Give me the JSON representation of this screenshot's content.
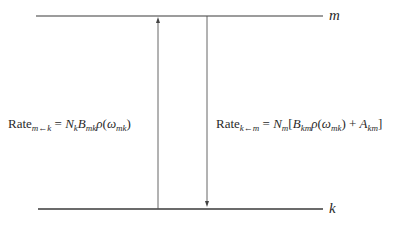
{
  "levels": {
    "upper": {
      "label": "m"
    },
    "lower": {
      "label": "k"
    }
  },
  "absorption": {
    "word": "Rate",
    "subscript": "m←k",
    "equals": "=",
    "N": "N",
    "N_sub": "k",
    "B": "B",
    "B_sub": "mk",
    "rho": "ρ",
    "omega": "ω",
    "omega_sub": "mk"
  },
  "emission": {
    "word": "Rate",
    "subscript": "k←m",
    "equals": "=",
    "N": "N",
    "N_sub": "m",
    "B": "B",
    "B_sub": "km",
    "rho": "ρ",
    "omega": "ω",
    "omega_sub": "mk",
    "plus": "+",
    "A": "A",
    "A_sub": "km"
  },
  "colors": {
    "line": "#3a3a3a",
    "text": "#2a2a2a"
  }
}
